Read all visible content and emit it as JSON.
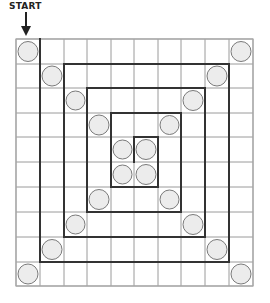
{
  "diagram": {
    "start_label": "START",
    "start_arrow": "down-arrow",
    "grid": {
      "rows": 10,
      "cols": 10,
      "x_edges": [
        16,
        40,
        64,
        87,
        111,
        134,
        158,
        181,
        205,
        229,
        253
      ],
      "y_edges": [
        39,
        64,
        88,
        113,
        137,
        162,
        187,
        212,
        237,
        262,
        286
      ],
      "thin_line_color": "#9a9a9a",
      "thick_line_color": "#333333"
    },
    "circles": {
      "fill": "#ececec",
      "stroke": "#7a7a7a",
      "cells": [
        [
          0,
          0
        ],
        [
          0,
          9
        ],
        [
          1,
          1
        ],
        [
          1,
          8
        ],
        [
          2,
          2
        ],
        [
          2,
          7
        ],
        [
          3,
          3
        ],
        [
          3,
          6
        ],
        [
          4,
          4
        ],
        [
          4,
          5
        ],
        [
          5,
          4
        ],
        [
          5,
          5
        ],
        [
          6,
          3
        ],
        [
          6,
          6
        ],
        [
          7,
          2
        ],
        [
          7,
          7
        ],
        [
          8,
          1
        ],
        [
          8,
          8
        ],
        [
          9,
          0
        ],
        [
          9,
          9
        ]
      ]
    },
    "spiral_path_grid": [
      [
        1,
        0
      ],
      [
        1,
        9
      ],
      [
        9,
        9
      ],
      [
        9,
        1
      ],
      [
        2,
        1
      ],
      [
        2,
        8
      ],
      [
        8,
        8
      ],
      [
        8,
        2
      ],
      [
        3,
        2
      ],
      [
        3,
        7
      ],
      [
        7,
        7
      ],
      [
        7,
        3
      ],
      [
        4,
        3
      ],
      [
        4,
        6
      ],
      [
        6,
        6
      ],
      [
        6,
        4
      ],
      [
        5,
        4
      ],
      [
        5,
        5
      ]
    ]
  }
}
